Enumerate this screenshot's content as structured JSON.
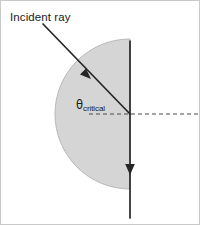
{
  "figure": {
    "width": 200,
    "height": 225,
    "background_color": "#ffffff",
    "border_color": "#c9c9c9"
  },
  "labels": {
    "incident_ray": "Incident ray",
    "theta_symbol": "θ",
    "theta_subscript": "critical"
  },
  "colors": {
    "medium_fill": "#d5d5d5",
    "medium_stroke": "#b8b8b8",
    "ray_stroke": "#262626",
    "dashed_stroke": "#4a4a4a",
    "text": "#1a1a1a"
  },
  "geometry": {
    "semicircle": {
      "center_x": 129,
      "center_y": 113,
      "radius": 75,
      "flat_edge_x": 129,
      "top_y": 38,
      "bottom_y": 188,
      "leftmost_x": 54,
      "path": "M 129 38 A 75 75 0 0 0 129 188 Z"
    },
    "incident_ray": {
      "x1": 42,
      "y1": 23,
      "x2": 129,
      "y2": 113,
      "arrow_x": 86,
      "arrow_y": 74
    },
    "vertical_ray": {
      "x": 129,
      "y1": 40,
      "y2": 217,
      "arrow_y": 168
    },
    "dashed_normal": {
      "x1": 88,
      "y1": 113,
      "x2": 200,
      "y2": 113,
      "dash_pattern": "4 3"
    },
    "stroke_widths": {
      "ray": 1.7,
      "dashed": 1.2,
      "medium_outline": 1
    }
  }
}
